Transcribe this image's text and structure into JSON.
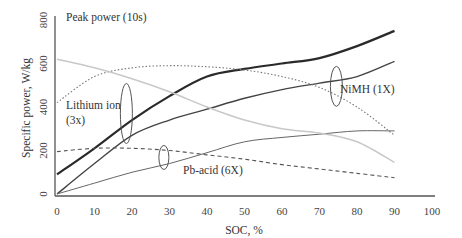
{
  "chart_data": {
    "type": "line",
    "title": "Peak power (10s)",
    "xlabel": "SOC, %",
    "ylabel": "Specific power, W/kg",
    "xlim": [
      0,
      100
    ],
    "ylim": [
      0,
      800
    ],
    "x_ticks": [
      "0",
      "10",
      "20",
      "30",
      "40",
      "50",
      "60",
      "70",
      "80",
      "90",
      "100"
    ],
    "y_ticks": [
      "0",
      "200",
      "400",
      "600",
      "800"
    ],
    "grid": false,
    "legend": "annotations",
    "annotations": [
      {
        "text": "Lithium ion",
        "line2": "(3x)",
        "x": 1,
        "y": 405
      },
      {
        "text": "NiMH (1X)",
        "x": 77,
        "y": 480
      },
      {
        "text": "Pb-acid (6X)",
        "x": 34,
        "y": 130
      }
    ],
    "series": [
      {
        "name": "Lithium ion - charge (upper)",
        "style": "solid-thick",
        "color": "#2a2a2a",
        "x": [
          0,
          10,
          20,
          30,
          40,
          50,
          60,
          70,
          80,
          90
        ],
        "values": [
          90,
          210,
          340,
          450,
          540,
          575,
          600,
          625,
          680,
          750
        ]
      },
      {
        "name": "Lithium ion / NiMH - charge",
        "style": "solid",
        "color": "#444444",
        "x": [
          0,
          10,
          20,
          30,
          40,
          50,
          60,
          70,
          80,
          90
        ],
        "values": [
          0,
          140,
          270,
          340,
          390,
          440,
          480,
          510,
          540,
          610
        ]
      },
      {
        "name": "Pb-acid - charge",
        "style": "solid-thin",
        "color": "#666666",
        "x": [
          0,
          10,
          20,
          30,
          40,
          50,
          60,
          70,
          80,
          90
        ],
        "values": [
          0,
          50,
          100,
          140,
          190,
          240,
          260,
          275,
          290,
          290
        ]
      },
      {
        "name": "Pb-acid - discharge",
        "style": "dashed",
        "color": "#555555",
        "x": [
          0,
          10,
          20,
          30,
          40,
          50,
          60,
          70,
          80,
          90
        ],
        "values": [
          195,
          210,
          210,
          200,
          180,
          160,
          135,
          115,
          95,
          75
        ]
      },
      {
        "name": "NiMH - discharge",
        "style": "dotted",
        "color": "#777777",
        "x": [
          0,
          10,
          20,
          30,
          40,
          50,
          60,
          70,
          80,
          90
        ],
        "values": [
          420,
          540,
          580,
          590,
          585,
          570,
          540,
          490,
          400,
          270
        ]
      },
      {
        "name": "Lithium ion - discharge",
        "style": "solid-light",
        "color": "#c8c8c8",
        "x": [
          0,
          10,
          20,
          30,
          40,
          50,
          60,
          70,
          80,
          90
        ],
        "values": [
          620,
          580,
          530,
          470,
          400,
          340,
          300,
          280,
          240,
          145
        ]
      }
    ]
  }
}
